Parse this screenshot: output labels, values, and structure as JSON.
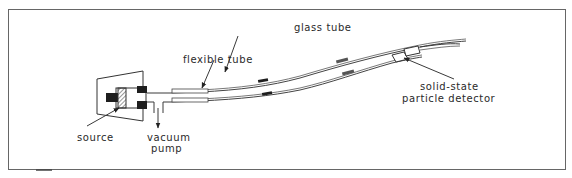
{
  "figure": {
    "type": "apparatus-schematic",
    "frame": {
      "stroke": "#555555",
      "background": "#ffffff"
    },
    "labels": {
      "glass_tube": "glass tube",
      "flexible_tube": "flexible tube",
      "source": "source",
      "vacuum_pump_line1": "vacuum",
      "vacuum_pump_line2": "pump",
      "detector_line1": "solid-state",
      "detector_line2": "particle detector"
    },
    "components": [
      {
        "name": "source",
        "description": "radioactive source in holder"
      },
      {
        "name": "vacuum-pump-port",
        "description": "T-junction to vacuum pump"
      },
      {
        "name": "flexible-tube",
        "description": "flexible tubing"
      },
      {
        "name": "glass-tube",
        "description": "curved glass tube"
      },
      {
        "name": "solid-state-particle-detector",
        "description": "detector at end of tube"
      }
    ]
  }
}
